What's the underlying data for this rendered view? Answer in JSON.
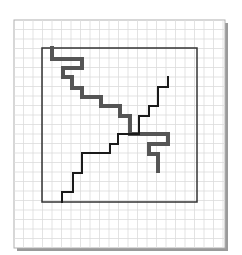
{
  "diagram": {
    "page": {
      "x": 14,
      "y": 20,
      "width": 211,
      "height": 228,
      "background": "#ffffff",
      "shadow": "#9a9a9a",
      "border": "#b0b0b0"
    },
    "grid": {
      "spacing": 9.5,
      "origin_x": 14,
      "origin_y": 20,
      "color": "#dcdcdc"
    },
    "frame": {
      "x": 42,
      "y": 48,
      "width": 155,
      "height": 154,
      "color": "#333333",
      "stroke_width": 1.5
    },
    "paths": [
      {
        "name": "thick-path",
        "color": "#555555",
        "stroke_width": 4,
        "points": [
          [
            52,
            48
          ],
          [
            52,
            59
          ],
          [
            82,
            59
          ],
          [
            82,
            68
          ],
          [
            63,
            68
          ],
          [
            63,
            77
          ],
          [
            72,
            77
          ],
          [
            72,
            88
          ],
          [
            82,
            88
          ],
          [
            82,
            97
          ],
          [
            101,
            97
          ],
          [
            101,
            106
          ],
          [
            120,
            106
          ],
          [
            120,
            116
          ],
          [
            130,
            116
          ],
          [
            130,
            134
          ],
          [
            168,
            134
          ],
          [
            168,
            144
          ],
          [
            149,
            144
          ],
          [
            149,
            154
          ],
          [
            158,
            154
          ],
          [
            158,
            171
          ]
        ]
      },
      {
        "name": "thin-path",
        "color": "#1a1a1a",
        "stroke_width": 2,
        "points": [
          [
            62,
            202
          ],
          [
            62,
            192
          ],
          [
            73,
            192
          ],
          [
            73,
            173
          ],
          [
            82,
            173
          ],
          [
            82,
            153
          ],
          [
            110,
            153
          ],
          [
            110,
            144
          ],
          [
            118,
            144
          ],
          [
            118,
            134
          ],
          [
            139,
            134
          ],
          [
            139,
            116
          ],
          [
            149,
            116
          ],
          [
            149,
            106
          ],
          [
            158,
            106
          ],
          [
            158,
            87
          ],
          [
            168,
            87
          ],
          [
            168,
            77
          ]
        ]
      }
    ]
  }
}
